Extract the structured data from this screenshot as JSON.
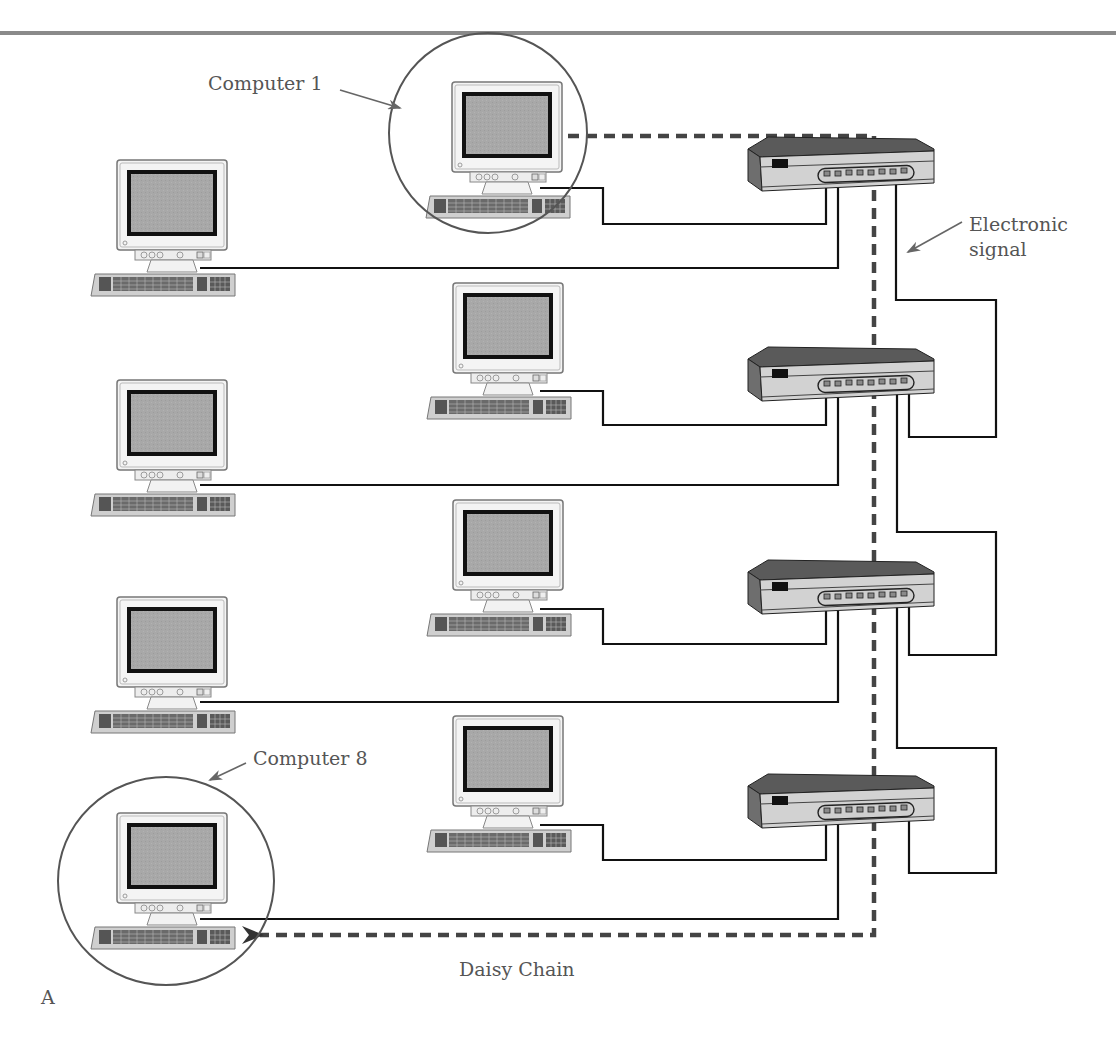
{
  "diagram": {
    "title_bar_color": "#8a8a8a",
    "labels": {
      "computer1": "Computer 1",
      "computer8": "Computer 8",
      "signal_line1": "Electronic",
      "signal_line2": "signal",
      "caption": "Daisy Chain",
      "panel_letter": "A"
    },
    "colors": {
      "cable": "#111111",
      "signal": "#444444",
      "screen": "#a9a9a9",
      "hub_top": "#5a5a5a",
      "hub_front": "#d2d2d2",
      "hub_side": "#6e6e6e",
      "label_text": "#555555",
      "callout_arrow": "#666666"
    },
    "computers": [
      {
        "id": "computer-1",
        "x": 428,
        "y": 102,
        "highlighted": true
      },
      {
        "id": "computer-2",
        "x": 96,
        "y": 160,
        "highlighted": false
      },
      {
        "id": "computer-3",
        "x": 430,
        "y": 282,
        "highlighted": false
      },
      {
        "id": "computer-4",
        "x": 96,
        "y": 380,
        "highlighted": false
      },
      {
        "id": "computer-5",
        "x": 430,
        "y": 500,
        "highlighted": false
      },
      {
        "id": "computer-6",
        "x": 96,
        "y": 597,
        "highlighted": false
      },
      {
        "id": "computer-7",
        "x": 430,
        "y": 716,
        "highlighted": false
      },
      {
        "id": "computer-8",
        "x": 96,
        "y": 813,
        "highlighted": true
      }
    ],
    "hubs": [
      {
        "id": "hub-1",
        "x": 748,
        "y": 137,
        "ports": 8
      },
      {
        "id": "hub-2",
        "x": 748,
        "y": 347,
        "ports": 8
      },
      {
        "id": "hub-3",
        "x": 748,
        "y": 560,
        "ports": 8
      },
      {
        "id": "hub-4",
        "x": 748,
        "y": 774,
        "ports": 8
      }
    ],
    "topology": "daisy chain of hubs"
  }
}
